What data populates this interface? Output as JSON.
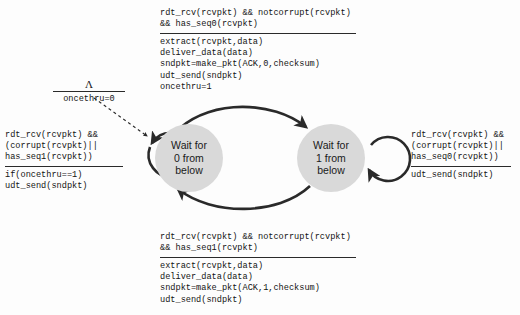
{
  "diagram": {
    "states": [
      {
        "id": "wait0",
        "line1": "Wait for",
        "line2": "0 from",
        "line3": "below"
      },
      {
        "id": "wait1",
        "line1": "Wait for",
        "line2": "1 from",
        "line3": "below"
      }
    ],
    "transitions": {
      "initial": {
        "condition": "Λ",
        "action": "oncethru=0"
      },
      "top": {
        "cond1": "rdt_rcv(rcvpkt) && notcorrupt(rcvpkt)",
        "cond2": "&& has_seq0(rcvpkt)",
        "act1": "extract(rcvpkt,data)",
        "act2": "deliver_data(data)",
        "act3": "sndpkt=make_pkt(ACK,0,checksum)",
        "act4": "udt_send(sndpkt)",
        "act5": "oncethru=1"
      },
      "bottom": {
        "cond1": "rdt_rcv(rcvpkt) && notcorrupt(rcvpkt)",
        "cond2": "&& has_seq1(rcvpkt)",
        "act1": "extract(rcvpkt,data)",
        "act2": "deliver_data(data)",
        "act3": "sndpkt=make_pkt(ACK,1,checksum)",
        "act4": "udt_send(sndpkt)"
      },
      "left_loop": {
        "cond1": "rdt_rcv(rcvpkt) &&",
        "cond2": "(corrupt(rcvpkt)||",
        "cond3": "has_seq1(rcvpkt))",
        "act1": "if(oncethru==1)",
        "act2": "udt_send(sndpkt)"
      },
      "right_loop": {
        "cond1": "rdt_rcv(rcvpkt) &&",
        "cond2": "(corrupt(rcvpkt)||",
        "cond3": "has_seq0(rcvpkt))",
        "act1": "udt_send(sndpkt)"
      }
    },
    "colors": {
      "state_fill": "#d9d9d9",
      "edge": "#2a2a2a",
      "text": "#141414",
      "background": "#fdfdfd"
    }
  }
}
